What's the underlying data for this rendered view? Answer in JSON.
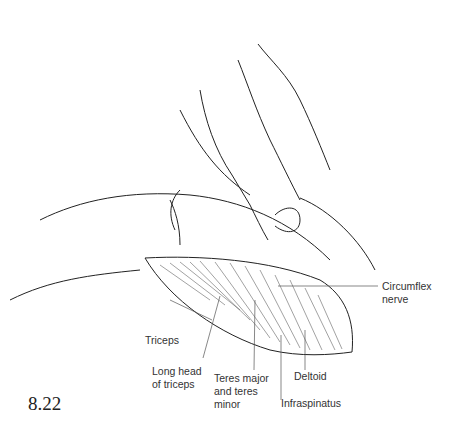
{
  "figure_number": "8.22",
  "labels": {
    "circumflex_nerve": [
      "Circumflex",
      "nerve"
    ],
    "triceps": "Triceps",
    "long_head_of_triceps": [
      "Long head",
      "of triceps"
    ],
    "teres_major_minor": [
      "Teres major",
      "and teres",
      "minor"
    ],
    "deltoid": "Deltoid",
    "infraspinatus": "Infraspinatus"
  }
}
